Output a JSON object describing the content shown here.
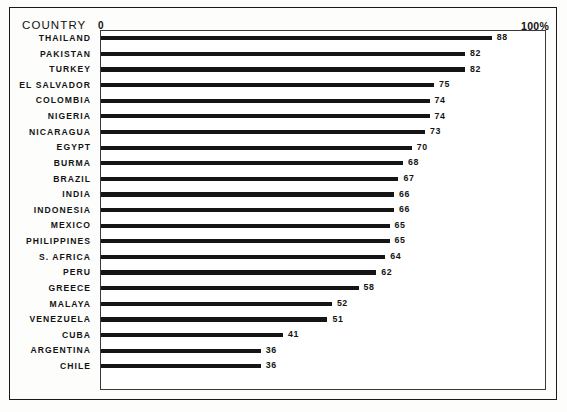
{
  "chart_data": {
    "type": "bar",
    "orientation": "horizontal",
    "title": "",
    "xlabel": "",
    "ylabel": "COUNTRY",
    "axis_start_label": "0",
    "axis_end_label": "100%",
    "xlim": [
      0,
      100
    ],
    "grid": false,
    "legend": null,
    "categories": [
      "THAILAND",
      "PAKISTAN",
      "TURKEY",
      "EL SALVADOR",
      "COLOMBIA",
      "NIGERIA",
      "NICARAGUA",
      "EGYPT",
      "BURMA",
      "BRAZIL",
      "INDIA",
      "INDONESIA",
      "MEXICO",
      "PHILIPPINES",
      "S. AFRICA",
      "PERU",
      "GREECE",
      "MALAYA",
      "VENEZUELA",
      "CUBA",
      "ARGENTINA",
      "CHILE"
    ],
    "values": [
      88,
      82,
      82,
      75,
      74,
      74,
      73,
      70,
      68,
      67,
      66,
      66,
      65,
      65,
      64,
      62,
      58,
      52,
      51,
      41,
      36,
      36
    ],
    "value_labels": [
      "88",
      "82",
      "82",
      "75",
      "74",
      "74",
      "73",
      "70",
      "68",
      "67",
      "66",
      "66",
      "65",
      "65",
      "64",
      "62",
      "58",
      "52",
      "51",
      "41",
      "36",
      "36"
    ],
    "bar_color": "#151515"
  },
  "chart": {
    "country_header": "COUNTRY",
    "zero_label": "0",
    "hundred_label": "100%"
  }
}
